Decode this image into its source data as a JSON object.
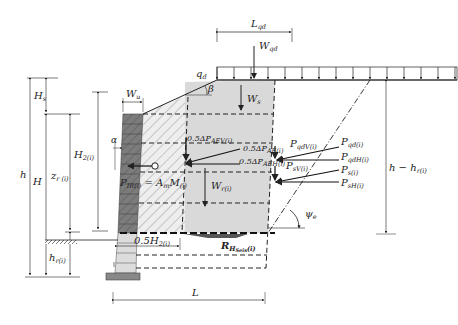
{
  "labels": {
    "L_qd": "L",
    "L_qd_sub": "qd",
    "W_qd": "W",
    "W_qd_sub": "qd",
    "q_d": "q",
    "q_d_sub": "d",
    "beta": "β",
    "W_s": "W",
    "W_s_sub": "s",
    "W_u": "W",
    "W_u_sub": "u",
    "alpha": "α",
    "H_s": "H",
    "H_s_sub": "s",
    "h": "h",
    "H": "H",
    "z_r": "z",
    "z_r_sub": "r (i)",
    "H2": "H",
    "H2_sub": "2(i)",
    "h_r": "h",
    "h_r_sub": "r(i)",
    "dPAEV": "0.5ΔP",
    "dPAEV_sub": "AEV(i)",
    "dPAE": "0.5ΔP",
    "dPAE_sub": "AE(i)",
    "dPAEH": "0.5ΔP",
    "dPAEH_sub": "AEH(i)",
    "PqdV": "P",
    "PqdV_sub": "qdV(i)",
    "PsV": "P",
    "PsV_sub": "sV(i)",
    "Pqd": "P",
    "Pqd_sub": "qd(i)",
    "PqdH": "P",
    "PqdH_sub": "qdH(i)",
    "Ps": "P",
    "Ps_sub": "s(i)",
    "PsH": "P",
    "PsH_sub": "sH(i)",
    "PIR": "P",
    "PIR_sub": "IR(i)",
    "PIR_eq": " = A",
    "PIR_m": "m",
    "PIR_M": "M",
    "PIR_M_sub": "(i)",
    "W_r": "W",
    "W_r_sub": "r(i)",
    "h_minus_hr": "h − h",
    "h_minus_hr_sub": "r(i)",
    "psi_e": "ψ",
    "psi_e_sub": "e",
    "half_H2": "0.5H",
    "half_H2_sub": "2(i)",
    "R_H": "R",
    "R_H_sub": "H",
    "R_H_subsub": "Seis",
    "R_H_tail": "(i)",
    "L": "L"
  },
  "colors": {
    "facing": "#7a7a7a",
    "facing_light": "#d6d6d6",
    "reinforced_fill": "#e4e4e4",
    "retained_fill": "#d9d9d9",
    "line": "#222222"
  }
}
